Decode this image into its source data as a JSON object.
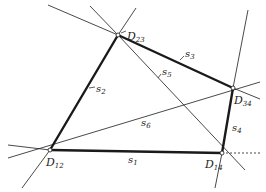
{
  "diagram": {
    "type": "quadrilateral-construction",
    "colors": {
      "ink": "#1a1a1a",
      "background": "#ffffff"
    },
    "vertices": [
      {
        "id": "D12",
        "label": "D",
        "sub": "12",
        "x": 50,
        "y": 150
      },
      {
        "id": "D23",
        "label": "D",
        "sub": "23",
        "x": 118,
        "y": 35
      },
      {
        "id": "D34",
        "label": "D",
        "sub": "34",
        "x": 233,
        "y": 88
      },
      {
        "id": "D14",
        "label": "D",
        "sub": "14",
        "x": 222,
        "y": 153
      }
    ],
    "edges": [
      {
        "id": "s1",
        "label": "s",
        "sub": "1",
        "from": "D12",
        "to": "D14",
        "weight": "thick"
      },
      {
        "id": "s2",
        "label": "s",
        "sub": "2",
        "from": "D12",
        "to": "D23",
        "weight": "thick"
      },
      {
        "id": "s3",
        "label": "s",
        "sub": "3",
        "from": "D23",
        "to": "D34",
        "weight": "thick"
      },
      {
        "id": "s4",
        "label": "s",
        "sub": "4",
        "from": "D34",
        "to": "D14",
        "weight": "thick"
      },
      {
        "id": "s5",
        "label": "s",
        "sub": "5",
        "from": "D23",
        "to": "D14",
        "weight": "thin"
      },
      {
        "id": "s6",
        "label": "s",
        "sub": "6",
        "from": "D12",
        "to": "D34",
        "weight": "thin"
      }
    ]
  }
}
